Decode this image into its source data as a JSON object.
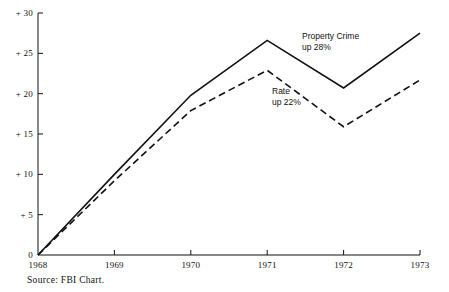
{
  "chart_data": {
    "type": "line",
    "title": "",
    "xlabel": "",
    "ylabel": "",
    "x": [
      "1968",
      "1969",
      "1970",
      "1971",
      "1972",
      "1973"
    ],
    "xlim": [
      1968,
      1973
    ],
    "ylim": [
      0,
      30
    ],
    "yticks": [
      0,
      5,
      10,
      15,
      20,
      25,
      30
    ],
    "ytick_labels": [
      "0",
      "+ 5",
      "+ 10",
      "+ 15",
      "+ 20",
      "+ 25",
      "+ 30"
    ],
    "xtick_labels": [
      "1968",
      "1969",
      "1970",
      "1971",
      "1972",
      "1973"
    ],
    "grid": false,
    "legend_position": "inline-annotations",
    "series": [
      {
        "name": "Property Crime",
        "style": "solid",
        "color": "#111111",
        "values": [
          0,
          10.0,
          19.8,
          26.6,
          20.7,
          27.5
        ]
      },
      {
        "name": "Rate",
        "style": "dashed",
        "color": "#111111",
        "values": [
          0,
          9.2,
          17.9,
          22.9,
          15.9,
          21.7
        ]
      }
    ],
    "annotations": [
      {
        "id": "property-crime",
        "line1": "Property Crime",
        "line2": "up 28%",
        "x": 302,
        "y": 31
      },
      {
        "id": "rate",
        "line1": "Rate",
        "line2": "up 22%",
        "x": 272,
        "y": 86
      }
    ],
    "source_note": "Source:  FBI  Chart."
  },
  "axes": {
    "origin_px": {
      "x": 38,
      "y": 255
    },
    "top_px": {
      "y": 13
    },
    "right_px": {
      "x": 420
    },
    "x_step_px": 76.4,
    "y_unit_px": 8.0667
  }
}
